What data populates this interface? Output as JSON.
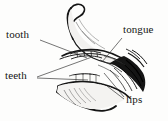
{
  "figure": {
    "type": "line-art anatomical illustration",
    "background_color": "#fdfdfc",
    "ink_color": "#151515",
    "leader_line_color": "#2a2a2a"
  },
  "labels": {
    "tooth": "tooth",
    "teeth": "teeth",
    "tongue": "tongue",
    "lips": "lips"
  },
  "annotations": [
    {
      "id": "tooth",
      "text": "tooth",
      "text_x": 6,
      "text_y": 29,
      "leaders": [
        {
          "x1": 40,
          "y1": 40,
          "x2": 87,
          "y2": 58
        }
      ]
    },
    {
      "id": "teeth",
      "text": "teeth",
      "text_x": 5,
      "text_y": 70,
      "leaders": [
        {
          "x1": 37,
          "y1": 77,
          "x2": 92,
          "y2": 57
        },
        {
          "x1": 37,
          "y1": 78,
          "x2": 88,
          "y2": 80
        }
      ]
    },
    {
      "id": "tongue",
      "text": "tongue",
      "text_x": 123,
      "text_y": 24,
      "leaders": [
        {
          "x1": 122,
          "y1": 38,
          "x2": 102,
          "y2": 62
        }
      ]
    },
    {
      "id": "lips",
      "text": "lips",
      "text_x": 126,
      "text_y": 94,
      "leaders": [
        {
          "x1": 124,
          "y1": 97,
          "x2": 104,
          "y2": 73
        },
        {
          "x1": 124,
          "y1": 99,
          "x2": 107,
          "y2": 86
        }
      ]
    }
  ]
}
